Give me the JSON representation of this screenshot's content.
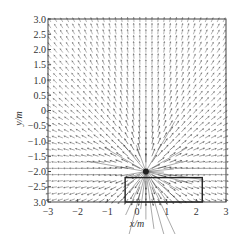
{
  "chart_data": {
    "type": "quiver",
    "title": "",
    "xlabel": "x/m",
    "ylabel": "y/m",
    "xlim": [
      -3,
      3
    ],
    "ylim": [
      -3,
      3
    ],
    "grid": false,
    "legend": null,
    "x_ticks": [
      {
        "value": -3,
        "label": "−3"
      },
      {
        "value": -2,
        "label": "−2"
      },
      {
        "value": -1,
        "label": "−1"
      },
      {
        "value": 0,
        "label": "0"
      },
      {
        "value": 1,
        "label": "1"
      },
      {
        "value": 2,
        "label": "2"
      },
      {
        "value": 3,
        "label": "3"
      }
    ],
    "y_ticks": [
      {
        "value": 3.0,
        "label": "3.0"
      },
      {
        "value": 2.5,
        "label": "2.5"
      },
      {
        "value": 2.0,
        "label": "2.0"
      },
      {
        "value": 1.5,
        "label": "1.5"
      },
      {
        "value": 1.0,
        "label": "1.0"
      },
      {
        "value": 0.5,
        "label": "0.5"
      },
      {
        "value": 0,
        "label": "0"
      },
      {
        "value": -0.5,
        "label": "−0.5"
      },
      {
        "value": -1.0,
        "label": "−1.0"
      },
      {
        "value": -1.5,
        "label": "−1.5"
      },
      {
        "value": -2.0,
        "label": "−2.0"
      },
      {
        "value": -2.5,
        "label": "−2.5"
      },
      {
        "value": -3.0,
        "label": "3.0"
      }
    ],
    "vector_field": {
      "description": "Radial vector field diverging from a source point; vectors longer near the source",
      "source_point": {
        "x": 0.3,
        "y": -2.0
      },
      "grid_spacing": 0.2,
      "arrow_color": "#555555"
    },
    "annotations": [
      {
        "type": "rectangle",
        "x0": -0.4,
        "x1": 2.2,
        "y0": -3.0,
        "y1": -2.2,
        "stroke": "#222222"
      }
    ]
  },
  "colors": {
    "axis": "#444444",
    "arrow": "#666666",
    "rectangle": "#222222"
  }
}
